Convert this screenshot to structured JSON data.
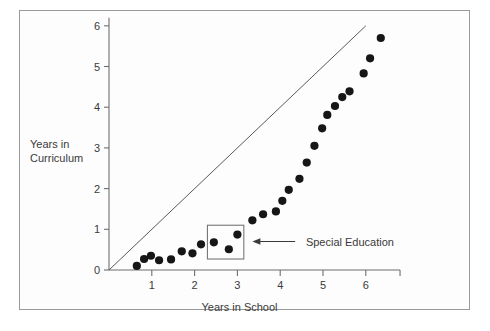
{
  "figure": {
    "background": "#ffffff",
    "frame_color": "#9a9a9a"
  },
  "chart_data": {
    "type": "scatter",
    "title": "",
    "xlabel": "Years in School",
    "ylabel": "Years in Curriculum",
    "xlim": [
      0,
      6.8
    ],
    "ylim": [
      0,
      6.2
    ],
    "xticks": [
      "1",
      "2",
      "3",
      "4",
      "5",
      "6"
    ],
    "xtick_values": [
      1,
      2,
      3,
      4,
      5,
      6
    ],
    "yticks": [
      "0",
      "1",
      "2",
      "3",
      "4",
      "5",
      "6"
    ],
    "ytick_values": [
      0,
      1,
      2,
      3,
      4,
      5,
      6
    ],
    "grid": false,
    "legend": "none",
    "series": [
      {
        "name": "Observed curriculum progress",
        "marker": "filled-circle",
        "color": "#161616",
        "points": [
          [
            0.65,
            0.1
          ],
          [
            0.82,
            0.27
          ],
          [
            0.98,
            0.35
          ],
          [
            1.17,
            0.24
          ],
          [
            1.45,
            0.26
          ],
          [
            1.7,
            0.46
          ],
          [
            1.95,
            0.41
          ],
          [
            2.15,
            0.63
          ],
          [
            2.45,
            0.68
          ],
          [
            2.8,
            0.51
          ],
          [
            3.0,
            0.87
          ],
          [
            3.35,
            1.22
          ],
          [
            3.6,
            1.37
          ],
          [
            3.9,
            1.44
          ],
          [
            4.05,
            1.7
          ],
          [
            4.2,
            1.97
          ],
          [
            4.45,
            2.24
          ],
          [
            4.62,
            2.64
          ],
          [
            4.8,
            3.05
          ],
          [
            4.98,
            3.48
          ],
          [
            5.1,
            3.81
          ],
          [
            5.28,
            4.03
          ],
          [
            5.45,
            4.25
          ],
          [
            5.62,
            4.39
          ],
          [
            5.95,
            4.83
          ],
          [
            6.1,
            5.2
          ],
          [
            6.35,
            5.7
          ]
        ]
      }
    ],
    "reference_line": {
      "name": "Expected one-to-one progress",
      "style": "solid-thin",
      "color": "#5a5a5a",
      "from": [
        0,
        0
      ],
      "to": [
        6.0,
        6.0
      ]
    },
    "annotations": [
      {
        "label": "Special Education",
        "marker": "arrow-left",
        "text_x": 4.6,
        "text_y": 0.7,
        "arrow_tip_x": 3.35,
        "arrow_tip_y": 0.7,
        "arrow_tail_x": 4.35,
        "arrow_tail_y": 0.7
      }
    ],
    "highlight_box": {
      "name": "special-education-region",
      "x0": 2.3,
      "x1": 3.15,
      "y0": 0.27,
      "y1": 1.1,
      "color": "#777777"
    }
  }
}
